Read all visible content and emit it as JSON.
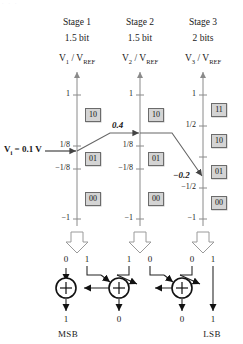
{
  "figure": {
    "type": "pipelined-adc-stage-diagram",
    "top_partial_caption": ". . .",
    "axis_positions_px": [
      77,
      140,
      203
    ],
    "stages": [
      {
        "title": "Stage 1",
        "resolution": "1.5 bit",
        "axis_label_main": "V",
        "axis_label_sub": "1",
        "axis_label_den_main": "V",
        "axis_label_den_sub": "REF",
        "ticks": [
          {
            "label": "1",
            "value": 1
          },
          {
            "label": "1/8",
            "value": 0.125
          },
          {
            "label": "−1/8",
            "value": -0.125
          },
          {
            "label": "−1",
            "value": -1
          }
        ],
        "codes": [
          {
            "label": "10",
            "value": 0.5
          },
          {
            "label": "01",
            "value": 0.0
          },
          {
            "label": "00",
            "value": -0.5
          }
        ],
        "input_value": "1/8",
        "output_value": "0.4",
        "decision_bits": [
          "0",
          "1"
        ]
      },
      {
        "title": "Stage 2",
        "resolution": "1.5 bit",
        "axis_label_main": "V",
        "axis_label_sub": "2",
        "axis_label_den_main": "V",
        "axis_label_den_sub": "REF",
        "ticks": [
          {
            "label": "1",
            "value": 1
          },
          {
            "label": "1/8",
            "value": 0.125
          },
          {
            "label": "−1/8",
            "value": -0.125
          },
          {
            "label": "−1",
            "value": -1
          }
        ],
        "codes": [
          {
            "label": "10",
            "value": 0.5
          },
          {
            "label": "01",
            "value": 0.0
          },
          {
            "label": "00",
            "value": -0.5
          }
        ],
        "input_value": "0.4",
        "output_value": "−0.2",
        "decision_bits": [
          "1",
          "0"
        ]
      },
      {
        "title": "Stage 3",
        "resolution": "2 bits",
        "axis_label_main": "V",
        "axis_label_sub": "3",
        "axis_label_den_main": "V",
        "axis_label_den_sub": "REF",
        "ticks": [
          {
            "label": "1",
            "value": 1
          },
          {
            "label": "1/2",
            "value": 0.5
          },
          {
            "label": "−1/2",
            "value": -0.5
          },
          {
            "label": "−1",
            "value": -1
          }
        ],
        "codes": [
          {
            "label": "11",
            "value": 0.75
          },
          {
            "label": "10",
            "value": 0.25
          },
          {
            "label": "01",
            "value": -0.25
          },
          {
            "label": "00",
            "value": -0.75
          }
        ],
        "input_value": "−0.2",
        "output_value": "",
        "decision_bits": [
          "0",
          "1"
        ]
      }
    ],
    "input_signal": {
      "label_main": "V",
      "label_sub": "i",
      "label_rest": "= 0.1 V"
    },
    "adder_symbol": "+",
    "output_bits": [
      "1",
      "0",
      "0",
      "1"
    ],
    "msb_label": "MSB",
    "lsb_label": "LSB",
    "colors": {
      "box_fill": "#d4d4d4",
      "box_stroke": "#6b6b6b",
      "axis": "#8a8a8a",
      "trace": "#555555",
      "ink": "#1a1a1a"
    }
  }
}
